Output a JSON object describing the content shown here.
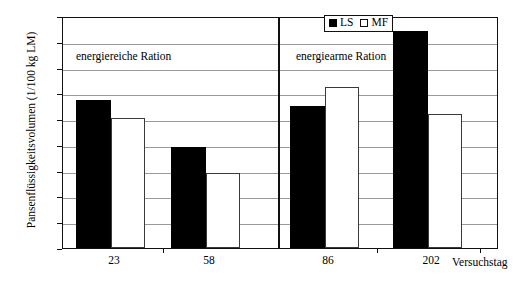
{
  "chart_data": {
    "type": "bar",
    "title": "",
    "xlabel": "Versuchstag",
    "ylabel": "Pansenflüssigkeitsvolumen (1/100 kg LM)",
    "categories": [
      "23",
      "58",
      "86",
      "202"
    ],
    "series": [
      {
        "name": "LS",
        "values": [
          11.5,
          7.8,
          11.0,
          16.8
        ],
        "color": "#000000"
      },
      {
        "name": "MF",
        "values": [
          10.1,
          5.8,
          12.5,
          10.4
        ],
        "color": "#ffffff"
      }
    ],
    "ylim": [
      0,
      18
    ],
    "yticks": [
      0,
      2,
      4,
      6,
      8,
      10,
      12,
      14,
      16,
      18
    ],
    "ytick_labels": [
      "0",
      "2",
      "4",
      "6",
      "8",
      "10",
      "12",
      "14",
      "16",
      "18"
    ],
    "grid": true,
    "legend_position": "top-center",
    "annotations": [
      {
        "text": "energiereiche Ration",
        "panel": "left"
      },
      {
        "text": "energiearme Ration",
        "panel": "right"
      }
    ],
    "panel_divider_after_category": "58"
  },
  "legend": {
    "entries": [
      {
        "label": "LS",
        "swatch": "filled-square-icon"
      },
      {
        "label": "MF",
        "swatch": "open-square-icon"
      }
    ]
  },
  "axes": {
    "y_title": "Pansenflüssigkeitsvolumen (1/100 kg LM)",
    "x_title": "Versuchstag"
  }
}
